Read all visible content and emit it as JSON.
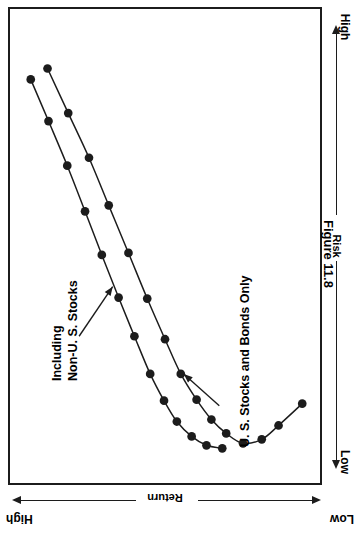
{
  "figure": {
    "caption": "Figure 11.8"
  },
  "axes": {
    "x": {
      "name": "Return",
      "label": "Return",
      "low_label": "Low",
      "high_label": "High",
      "orientation": "bottom-rotated-180",
      "direction": "high-at-left, low-at-right"
    },
    "y": {
      "name": "Risk",
      "label": "Risk",
      "low_label": "Low",
      "high_label": "High",
      "orientation": "right-vertical",
      "direction": "low-at-bottom, high-at-top"
    }
  },
  "annotations": [
    {
      "id": "including-non-us",
      "line1": "Including",
      "line2": "Non-U. S. Stocks",
      "points_to": "upper-left-curve"
    },
    {
      "id": "us-only",
      "line1": "U. S. Stocks and Bonds Only",
      "line2": "",
      "points_to": "lower-right-curve"
    }
  ],
  "colors": {
    "line": "#1c1c1c",
    "marker": "#1c1c1c",
    "frame": "#1c1c1c",
    "background": "#ffffff"
  },
  "chart_data": {
    "type": "line",
    "title": "Figure 11.8",
    "xlabel": "Return",
    "ylabel": "Risk",
    "xlim": [
      0,
      314
    ],
    "ylim": [
      0,
      478
    ],
    "grid": false,
    "legend": "annotations-inline",
    "note": "Efficient frontier style chart drawn rotated 90 degrees on the page. Coordinates below are in plot-frame pixel space (x right, y down).",
    "series": [
      {
        "name": "Including Non-U. S. Stocks",
        "marker": "filled-circle",
        "points": [
          [
            21,
            71
          ],
          [
            39,
            113
          ],
          [
            58,
            158
          ],
          [
            76,
            204
          ],
          [
            93,
            248
          ],
          [
            110,
            291
          ],
          [
            126,
            330
          ],
          [
            142,
            368
          ],
          [
            156,
            395
          ],
          [
            169,
            416
          ],
          [
            184,
            431
          ],
          [
            199,
            440
          ],
          [
            215,
            443
          ]
        ]
      },
      {
        "name": "U. S. Stocks and Bonds Only",
        "marker": "filled-circle",
        "points": [
          [
            38,
            60
          ],
          [
            59,
            105
          ],
          [
            80,
            150
          ],
          [
            100,
            198
          ],
          [
            120,
            246
          ],
          [
            139,
            292
          ],
          [
            157,
            333
          ],
          [
            173,
            368
          ],
          [
            189,
            394
          ],
          [
            204,
            414
          ],
          [
            219,
            428
          ],
          [
            236,
            438
          ],
          [
            255,
            434
          ],
          [
            272,
            420
          ],
          [
            296,
            398
          ]
        ]
      }
    ]
  }
}
